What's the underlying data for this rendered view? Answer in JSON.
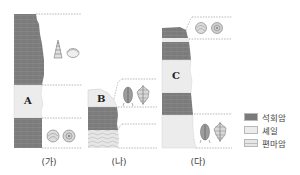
{
  "figure": {
    "columns": [
      {
        "id": "ga",
        "caption": "(가)",
        "layers_top_to_bottom": [
          "limestone",
          "shale (A)",
          "limestone"
        ],
        "label": "A",
        "fossils": [
          {
            "name": "gastropod",
            "position": "upper"
          },
          {
            "name": "bivalve",
            "position": "upper"
          },
          {
            "name": "ammonite",
            "position": "lower"
          },
          {
            "name": "ammonite",
            "position": "lower"
          }
        ]
      },
      {
        "id": "na",
        "caption": "(나)",
        "layers_top_to_bottom": [
          "shale (B)",
          "limestone",
          "sandstone"
        ],
        "label": "B",
        "fossils": [
          {
            "name": "trilobite",
            "position": "upper"
          },
          {
            "name": "graptolite",
            "position": "upper"
          }
        ]
      },
      {
        "id": "da",
        "caption": "(다)",
        "layers_top_to_bottom": [
          "limestone",
          "shale",
          "limestone",
          "shale (C)",
          "limestone",
          "shale"
        ],
        "label": "C",
        "fossils": [
          {
            "name": "ammonite",
            "position": "top"
          },
          {
            "name": "ammonite",
            "position": "top"
          },
          {
            "name": "trilobite",
            "position": "bottom"
          },
          {
            "name": "graptolite",
            "position": "bottom"
          }
        ]
      }
    ],
    "legend": [
      {
        "key": "limestone",
        "label": "석회암",
        "color": "#7a7a7a"
      },
      {
        "key": "shale",
        "label": "셰일",
        "color": "#ececec"
      },
      {
        "key": "sandstone",
        "label": "편마암",
        "color": "#e3e3e3"
      }
    ],
    "colors": {
      "limestone": "#7a7a7a",
      "shale": "#ececec",
      "dash": "#9a9a9a",
      "fossil": "#888888"
    }
  }
}
